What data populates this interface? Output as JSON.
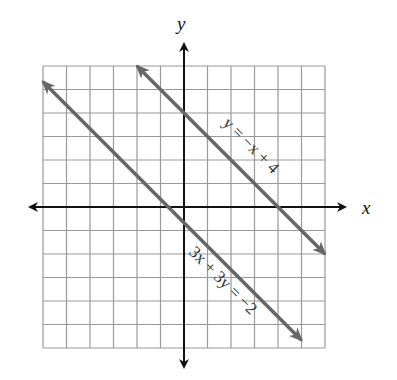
{
  "chart_data": {
    "type": "line",
    "title": "",
    "xlabel": "x",
    "ylabel": "y",
    "xlim": [
      -6,
      6
    ],
    "ylim": [
      -6,
      6
    ],
    "grid": true,
    "grid_step": 1,
    "series": [
      {
        "name": "y = -x + 4",
        "label": "y = −x + 4",
        "slope": -1,
        "intercept": 4,
        "x": [
          -2,
          6
        ],
        "y": [
          6,
          -2
        ]
      },
      {
        "name": "3x + 3y = -2",
        "label": "3x + 3y = −2",
        "slope": -1,
        "intercept": -0.6667,
        "x": [
          -6,
          5
        ],
        "y": [
          5.333,
          -5.667
        ]
      }
    ]
  },
  "axes": {
    "x_label": "x",
    "y_label": "y"
  },
  "labels": {
    "line1": "y = −x + 4",
    "line2": "3x + 3y = −2"
  }
}
